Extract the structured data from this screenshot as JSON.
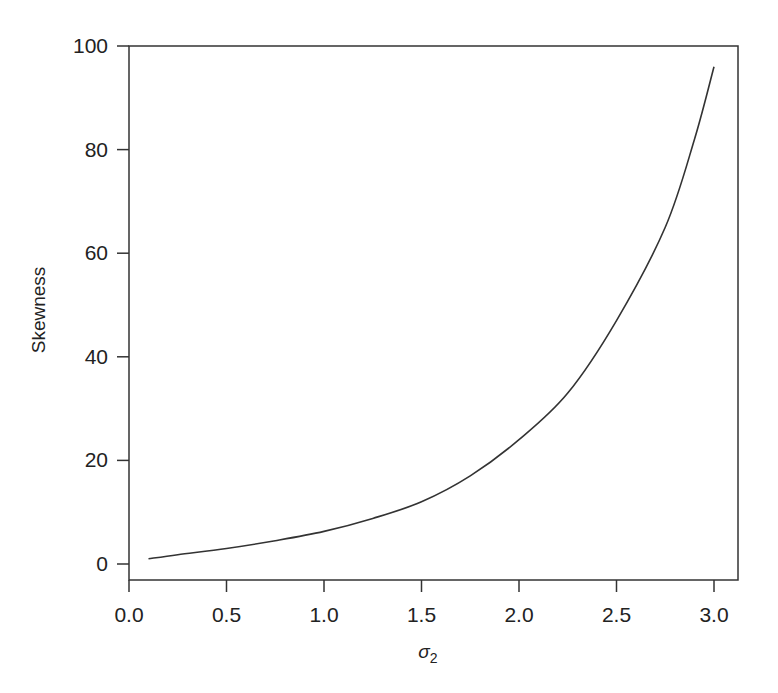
{
  "chart_data": {
    "type": "line",
    "title": "",
    "xlabel": "σ2",
    "xlabel_base": "σ",
    "xlabel_sub": "2",
    "ylabel": "Skewness",
    "xlim": [
      0.0,
      3.1
    ],
    "ylim": [
      -3,
      100
    ],
    "grid": false,
    "legend": null,
    "x_ticks": [
      "0.0",
      "0.5",
      "1.0",
      "1.5",
      "2.0",
      "2.5",
      "3.0"
    ],
    "y_ticks": [
      "0",
      "20",
      "40",
      "60",
      "80",
      "100"
    ],
    "series": [
      {
        "name": "skewness",
        "x": [
          0.1,
          0.25,
          0.5,
          0.75,
          1.0,
          1.25,
          1.5,
          1.75,
          2.0,
          2.25,
          2.5,
          2.75,
          2.9,
          3.0
        ],
        "y": [
          1,
          1.8,
          3,
          4.5,
          6.3,
          8.8,
          12,
          17,
          24,
          33,
          47,
          65,
          82,
          96
        ]
      }
    ]
  }
}
